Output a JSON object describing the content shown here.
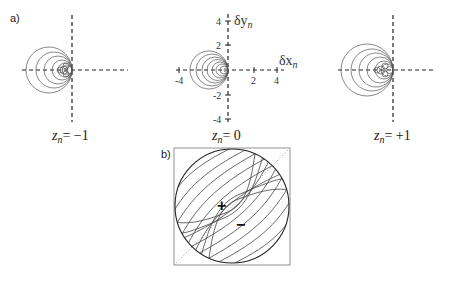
{
  "panel_a": {
    "label": "a)",
    "subplots": [
      {
        "id": "left",
        "z_label": "z",
        "z_sub": "n",
        "z_value": "= −1",
        "axis_x": 72,
        "axis_y": 70
      },
      {
        "id": "center",
        "z_label": "z",
        "z_sub": "n",
        "z_value": "= 0",
        "axis_x": 228,
        "axis_y": 70
      },
      {
        "id": "right",
        "z_label": "z",
        "z_sub": "n",
        "z_value": "= +1",
        "axis_x": 393,
        "axis_y": 70
      }
    ],
    "center_axes": {
      "x_label": "δx",
      "x_sub": "n",
      "y_label": "δy",
      "y_sub": "n",
      "x_ticks": [
        "-4",
        "2",
        "4"
      ],
      "y_ticks": [
        "4",
        "2",
        "-2",
        "-4"
      ]
    }
  },
  "panel_b": {
    "label": "b)",
    "plus_sign": "+",
    "minus_sign": "−"
  }
}
